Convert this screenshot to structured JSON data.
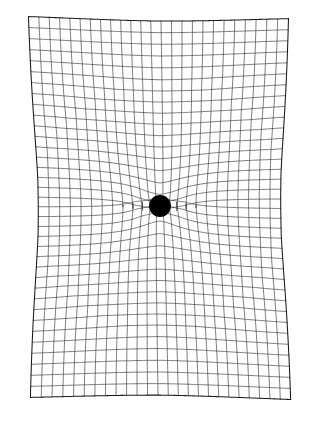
{
  "figure": {
    "title": "Spacetime curvature grid around a point mass",
    "description": "A rectangular coordinate grid deformed by a central massive body, illustrating gravitational curvature of space.",
    "background_color": "#ffffff",
    "line_color": "#2b2b2b",
    "edge_line_color": "#1a1a1a",
    "mass_color": "#000000"
  },
  "canvas": {
    "width": 317,
    "height": 436
  },
  "grid": {
    "left": 25,
    "top": 11,
    "right": 294,
    "bottom": 405,
    "columns": 25,
    "rows": 36,
    "cell_width": 10.76,
    "cell_height": 10.94,
    "line_width": 0.62,
    "border_line_width": 1.05,
    "skew_x": 4.5,
    "skew_y": 2.0
  },
  "mass": {
    "label": "central-mass",
    "center_x": 160,
    "center_y": 206,
    "radius": 11,
    "color": "#000000"
  },
  "deformation": {
    "model": "radial-gravitational-well",
    "strength": 1900,
    "core_softening": 26,
    "max_pull": 13.5,
    "vertical_funnel": 0.55,
    "far_field_falloff": 2.0
  },
  "chart_data": {
    "type": "line",
    "title": "Spacetime curvature grid around a point mass",
    "subtitle": "",
    "xlabel": "",
    "ylabel": "",
    "xlim": [
      25,
      294
    ],
    "ylim": [
      11,
      405
    ],
    "grid": true,
    "legend_position": "none",
    "annotations": [
      {
        "name": "central-mass",
        "shape": "filled-circle",
        "x": 160,
        "y": 206,
        "radius": 11,
        "color": "#000000"
      }
    ],
    "series": [
      {
        "name": "vertical-grid-lines",
        "count": 25,
        "orientation": "vertical",
        "description": "Lines of constant x, bowed inward toward the mass"
      },
      {
        "name": "horizontal-grid-lines",
        "count": 36,
        "orientation": "horizontal",
        "description": "Lines of constant y, drawn downward/inward toward the mass"
      }
    ]
  }
}
